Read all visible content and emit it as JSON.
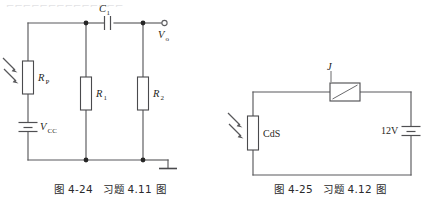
{
  "page": {
    "width": 440,
    "height": 203,
    "background": "#ffffff",
    "ink_color": "#59595c"
  },
  "figures": [
    {
      "id": "fig-4-24",
      "caption": "图 4-24　习题 4.11 图",
      "caption_number": "图 4-24",
      "caption_title": "习题 4.11 图",
      "type": "schematic",
      "description": "photoresistor bias circuit with coupling capacitor",
      "components": [
        {
          "ref": "Rp",
          "name": "photoresistor-rp",
          "label": "R",
          "subscript": "P",
          "kind": "photoresistor"
        },
        {
          "ref": "VCC",
          "name": "battery-vcc",
          "label": "V",
          "subscript": "CC",
          "kind": "battery"
        },
        {
          "ref": "R1",
          "name": "resistor-r1",
          "label": "R",
          "subscript": "1",
          "kind": "resistor"
        },
        {
          "ref": "R2",
          "name": "resistor-r2",
          "label": "R",
          "subscript": "2",
          "kind": "resistor"
        },
        {
          "ref": "C1",
          "name": "capacitor-c1",
          "label": "C",
          "subscript": "1",
          "kind": "capacitor"
        },
        {
          "ref": "Vo",
          "name": "output-terminal-vo",
          "label": "V",
          "subscript": "o",
          "kind": "output-terminal"
        },
        {
          "ref": "GND",
          "name": "ground-symbol",
          "label": "",
          "subscript": "",
          "kind": "ground"
        }
      ]
    },
    {
      "id": "fig-4-25",
      "caption": "图 4-25　习题 4.12 图",
      "caption_number": "图 4-25",
      "caption_title": "习题 4.12 图",
      "type": "schematic",
      "description": "CdS photoresistor in series with relay coil and 12V supply",
      "components": [
        {
          "ref": "CdS",
          "name": "photoresistor-cds",
          "label": "CdS",
          "subscript": "",
          "kind": "photoresistor"
        },
        {
          "ref": "J",
          "name": "relay-coil-j",
          "label": "J",
          "subscript": "",
          "kind": "relay-coil"
        },
        {
          "ref": "E",
          "name": "battery-12v",
          "label": "12V",
          "subscript": "",
          "kind": "battery"
        }
      ]
    }
  ],
  "top_bleed_text": "⌐⌐⌐⌐⌐⌐⌐⌐⌐⌐⌐⌐⌐⌐"
}
